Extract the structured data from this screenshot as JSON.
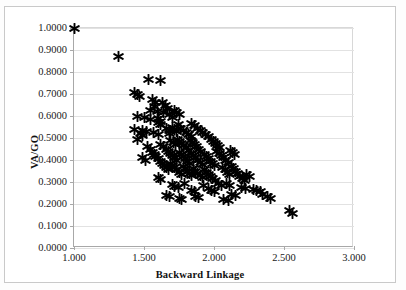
{
  "chart_data": {
    "type": "scatter",
    "title": "",
    "xlabel": "Backward Linkage",
    "ylabel": "VA/GO",
    "xlim": [
      1.0,
      3.0
    ],
    "ylim": [
      0.0,
      1.0
    ],
    "xticks": [
      "1.000",
      "1.500",
      "2.000",
      "2.500",
      "3.000"
    ],
    "xtick_values": [
      1.0,
      1.5,
      2.0,
      2.5,
      3.0
    ],
    "yticks": [
      "0.0000",
      "0.1000",
      "0.2000",
      "0.3000",
      "0.4000",
      "0.5000",
      "0.6000",
      "0.7000",
      "0.8000",
      "0.9000",
      "1.0000"
    ],
    "ytick_values": [
      0.0,
      0.1,
      0.2,
      0.3,
      0.4,
      0.5,
      0.6,
      0.7,
      0.8,
      0.9,
      1.0
    ],
    "grid": "horizontal",
    "legend": "none",
    "marker_style": "asterisk",
    "marker_color": "#000000",
    "series": [
      {
        "name": "observations",
        "points": [
          [
            1.0,
            1.0
          ],
          [
            1.315,
            0.87
          ],
          [
            1.53,
            0.765
          ],
          [
            1.62,
            0.76
          ],
          [
            1.43,
            0.705
          ],
          [
            1.455,
            0.7
          ],
          [
            1.47,
            0.69
          ],
          [
            1.56,
            0.675
          ],
          [
            1.585,
            0.66
          ],
          [
            1.575,
            0.645
          ],
          [
            1.63,
            0.66
          ],
          [
            1.65,
            0.65
          ],
          [
            1.665,
            0.635
          ],
          [
            1.455,
            0.6
          ],
          [
            1.5,
            0.595
          ],
          [
            1.545,
            0.585
          ],
          [
            1.6,
            0.59
          ],
          [
            1.62,
            0.575
          ],
          [
            1.43,
            0.54
          ],
          [
            1.49,
            0.535
          ],
          [
            1.52,
            0.53
          ],
          [
            1.565,
            0.525
          ],
          [
            1.455,
            0.495
          ],
          [
            1.6,
            0.515
          ],
          [
            1.68,
            0.52
          ],
          [
            1.7,
            0.55
          ],
          [
            1.715,
            0.54
          ],
          [
            1.73,
            0.53
          ],
          [
            1.745,
            0.56
          ],
          [
            1.76,
            0.545
          ],
          [
            1.78,
            0.535
          ],
          [
            1.8,
            0.525
          ],
          [
            1.82,
            0.515
          ],
          [
            1.84,
            0.505
          ],
          [
            1.69,
            0.49
          ],
          [
            1.71,
            0.48
          ],
          [
            1.725,
            0.47
          ],
          [
            1.74,
            0.495
          ],
          [
            1.755,
            0.485
          ],
          [
            1.77,
            0.475
          ],
          [
            1.785,
            0.465
          ],
          [
            1.8,
            0.455
          ],
          [
            1.815,
            0.445
          ],
          [
            1.83,
            0.49
          ],
          [
            1.845,
            0.48
          ],
          [
            1.86,
            0.47
          ],
          [
            1.875,
            0.46
          ],
          [
            1.89,
            0.45
          ],
          [
            1.905,
            0.44
          ],
          [
            1.62,
            0.47
          ],
          [
            1.64,
            0.46
          ],
          [
            1.66,
            0.45
          ],
          [
            1.675,
            0.44
          ],
          [
            1.69,
            0.43
          ],
          [
            1.705,
            0.42
          ],
          [
            1.72,
            0.41
          ],
          [
            1.735,
            0.4
          ],
          [
            1.75,
            0.435
          ],
          [
            1.765,
            0.425
          ],
          [
            1.78,
            0.415
          ],
          [
            1.795,
            0.405
          ],
          [
            1.81,
            0.395
          ],
          [
            1.825,
            0.385
          ],
          [
            1.84,
            0.43
          ],
          [
            1.855,
            0.42
          ],
          [
            1.87,
            0.41
          ],
          [
            1.885,
            0.4
          ],
          [
            1.9,
            0.39
          ],
          [
            1.915,
            0.38
          ],
          [
            1.93,
            0.425
          ],
          [
            1.945,
            0.415
          ],
          [
            1.96,
            0.405
          ],
          [
            1.975,
            0.395
          ],
          [
            1.99,
            0.385
          ],
          [
            2.005,
            0.375
          ],
          [
            1.58,
            0.415
          ],
          [
            1.6,
            0.405
          ],
          [
            1.615,
            0.395
          ],
          [
            1.63,
            0.385
          ],
          [
            1.645,
            0.375
          ],
          [
            1.66,
            0.365
          ],
          [
            1.675,
            0.355
          ],
          [
            1.69,
            0.385
          ],
          [
            1.705,
            0.375
          ],
          [
            1.72,
            0.365
          ],
          [
            1.735,
            0.355
          ],
          [
            1.75,
            0.345
          ],
          [
            1.765,
            0.335
          ],
          [
            1.78,
            0.37
          ],
          [
            1.795,
            0.36
          ],
          [
            1.81,
            0.35
          ],
          [
            1.825,
            0.34
          ],
          [
            1.84,
            0.33
          ],
          [
            1.855,
            0.36
          ],
          [
            1.87,
            0.35
          ],
          [
            1.885,
            0.34
          ],
          [
            1.9,
            0.33
          ],
          [
            1.915,
            0.32
          ],
          [
            1.93,
            0.355
          ],
          [
            1.945,
            0.345
          ],
          [
            1.96,
            0.335
          ],
          [
            1.975,
            0.325
          ],
          [
            1.99,
            0.315
          ],
          [
            2.02,
            0.44
          ],
          [
            2.04,
            0.43
          ],
          [
            2.055,
            0.42
          ],
          [
            2.07,
            0.41
          ],
          [
            2.085,
            0.4
          ],
          [
            2.1,
            0.39
          ],
          [
            2.115,
            0.445
          ],
          [
            2.13,
            0.435
          ],
          [
            2.145,
            0.425
          ],
          [
            2.06,
            0.365
          ],
          [
            2.08,
            0.355
          ],
          [
            2.095,
            0.345
          ],
          [
            2.11,
            0.335
          ],
          [
            2.125,
            0.37
          ],
          [
            2.14,
            0.36
          ],
          [
            2.155,
            0.35
          ],
          [
            2.17,
            0.34
          ],
          [
            2.01,
            0.305
          ],
          [
            2.03,
            0.295
          ],
          [
            2.05,
            0.285
          ],
          [
            1.7,
            0.29
          ],
          [
            1.72,
            0.28
          ],
          [
            1.745,
            0.275
          ],
          [
            1.79,
            0.295
          ],
          [
            1.84,
            0.26
          ],
          [
            1.86,
            0.255
          ],
          [
            1.925,
            0.285
          ],
          [
            1.96,
            0.27
          ],
          [
            2.09,
            0.295
          ],
          [
            2.11,
            0.285
          ],
          [
            2.18,
            0.325
          ],
          [
            2.2,
            0.315
          ],
          [
            2.215,
            0.305
          ],
          [
            2.235,
            0.335
          ],
          [
            2.25,
            0.325
          ],
          [
            2.195,
            0.275
          ],
          [
            2.225,
            0.27
          ],
          [
            2.28,
            0.265
          ],
          [
            2.3,
            0.26
          ],
          [
            2.33,
            0.255
          ],
          [
            2.345,
            0.245
          ],
          [
            2.38,
            0.235
          ],
          [
            2.4,
            0.225
          ],
          [
            2.54,
            0.17
          ],
          [
            2.56,
            0.155
          ],
          [
            1.545,
            0.625
          ],
          [
            1.595,
            0.62
          ],
          [
            1.64,
            0.615
          ],
          [
            1.68,
            0.605
          ],
          [
            1.7,
            0.595
          ],
          [
            1.715,
            0.625
          ],
          [
            1.735,
            0.615
          ],
          [
            1.755,
            0.605
          ],
          [
            1.84,
            0.565
          ],
          [
            1.86,
            0.555
          ],
          [
            1.88,
            0.545
          ],
          [
            1.9,
            0.535
          ],
          [
            1.92,
            0.525
          ],
          [
            1.94,
            0.515
          ],
          [
            1.96,
            0.505
          ],
          [
            1.98,
            0.495
          ],
          [
            1.995,
            0.485
          ],
          [
            2.01,
            0.475
          ],
          [
            2.025,
            0.465
          ],
          [
            2.04,
            0.455
          ],
          [
            1.525,
            0.46
          ],
          [
            1.545,
            0.45
          ],
          [
            1.56,
            0.435
          ],
          [
            1.575,
            0.425
          ],
          [
            1.49,
            0.41
          ],
          [
            1.51,
            0.4
          ],
          [
            1.605,
            0.32
          ],
          [
            1.62,
            0.31
          ],
          [
            1.66,
            0.24
          ],
          [
            1.68,
            0.235
          ],
          [
            2.125,
            0.245
          ],
          [
            2.155,
            0.24
          ],
          [
            1.75,
            0.225
          ],
          [
            1.77,
            0.22
          ],
          [
            2.07,
            0.22
          ],
          [
            2.1,
            0.215
          ],
          [
            1.87,
            0.235
          ],
          [
            1.89,
            0.23
          ],
          [
            1.98,
            0.26
          ],
          [
            2.0,
            0.255
          ],
          [
            1.68,
            0.535
          ],
          [
            1.66,
            0.545
          ],
          [
            1.62,
            0.56
          ],
          [
            1.6,
            0.57
          ],
          [
            1.49,
            0.51
          ],
          [
            1.475,
            0.52
          ]
        ]
      }
    ]
  },
  "axis_titles": {
    "x": "Backward Linkage",
    "y": "VA/GO"
  }
}
